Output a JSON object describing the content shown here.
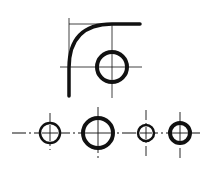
{
  "canvas": {
    "width": 212,
    "height": 171,
    "background": "#ffffff",
    "ink": "#111111"
  },
  "top_figure": {
    "fillet_curve": "M69,96 L69,68 Q69,24 112,24 L140,24",
    "thin_lines": [
      {
        "x1": 69,
        "y1": 18,
        "x2": 69,
        "y2": 68
      },
      {
        "x1": 69,
        "y1": 24,
        "x2": 112,
        "y2": 24
      },
      {
        "x1": 60,
        "y1": 67,
        "x2": 142,
        "y2": 67
      },
      {
        "x1": 112,
        "y1": 24,
        "x2": 112,
        "y2": 98
      }
    ],
    "circle": {
      "cx": 112,
      "cy": 67,
      "r": 15,
      "stroke": 4
    }
  },
  "bottom_row": {
    "centerline": {
      "x1": 12,
      "y1": 133,
      "x2": 200,
      "y2": 133
    },
    "circles": [
      {
        "cx": 50,
        "cy": 133,
        "r": 10,
        "stroke": 2.5,
        "vtop": 113,
        "vbot": 150
      },
      {
        "cx": 98,
        "cy": 133,
        "r": 15,
        "stroke": 4,
        "vtop": 107,
        "vbot": 160
      },
      {
        "cx": 146,
        "cy": 133,
        "r": 8,
        "stroke": 2.5,
        "vtop": 110,
        "vbot": 157
      },
      {
        "cx": 180,
        "cy": 133,
        "r": 10,
        "stroke": 4,
        "vtop": 112,
        "vbot": 158
      }
    ]
  }
}
